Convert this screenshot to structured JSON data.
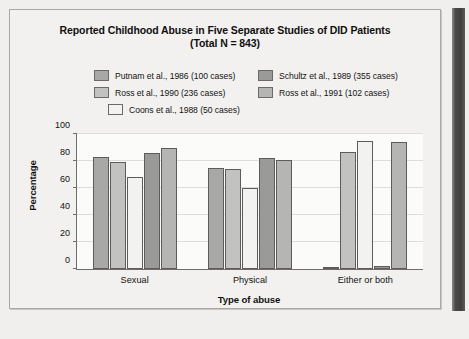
{
  "figure": {
    "title_line1": "Reported Childhood Abuse in Five Separate Studies of DID Patients",
    "title_line2": "(Total N = 843)"
  },
  "chart_data": {
    "type": "bar",
    "title": "Reported Childhood Abuse in Five Separate Studies of DID Patients (Total N = 843)",
    "xlabel": "Type of abuse",
    "ylabel": "Percentage",
    "ylim": [
      0,
      100
    ],
    "yticks": [
      0,
      20,
      40,
      60,
      80,
      100
    ],
    "grid": true,
    "legend_position": "top",
    "categories": [
      "Sexual",
      "Physical",
      "Either or both"
    ],
    "series": [
      {
        "name": "Putnam et al., 1986 (100 cases)",
        "color": "#a8a8a6",
        "values": [
          83,
          75,
          1
        ]
      },
      {
        "name": "Ross et al., 1990 (236 cases)",
        "color": "#c2c2c0",
        "values": [
          79,
          74,
          87
        ]
      },
      {
        "name": "Coons et al., 1988 (50 cases)",
        "color": "#f2f2f0",
        "values": [
          68,
          60,
          95
        ]
      },
      {
        "name": "Schultz et al., 1989 (355 cases)",
        "color": "#9a9a98",
        "values": [
          86,
          82,
          2
        ]
      },
      {
        "name": "Ross et al., 1991 (102 cases)",
        "color": "#b5b5b3",
        "values": [
          90,
          81,
          94
        ]
      }
    ]
  }
}
